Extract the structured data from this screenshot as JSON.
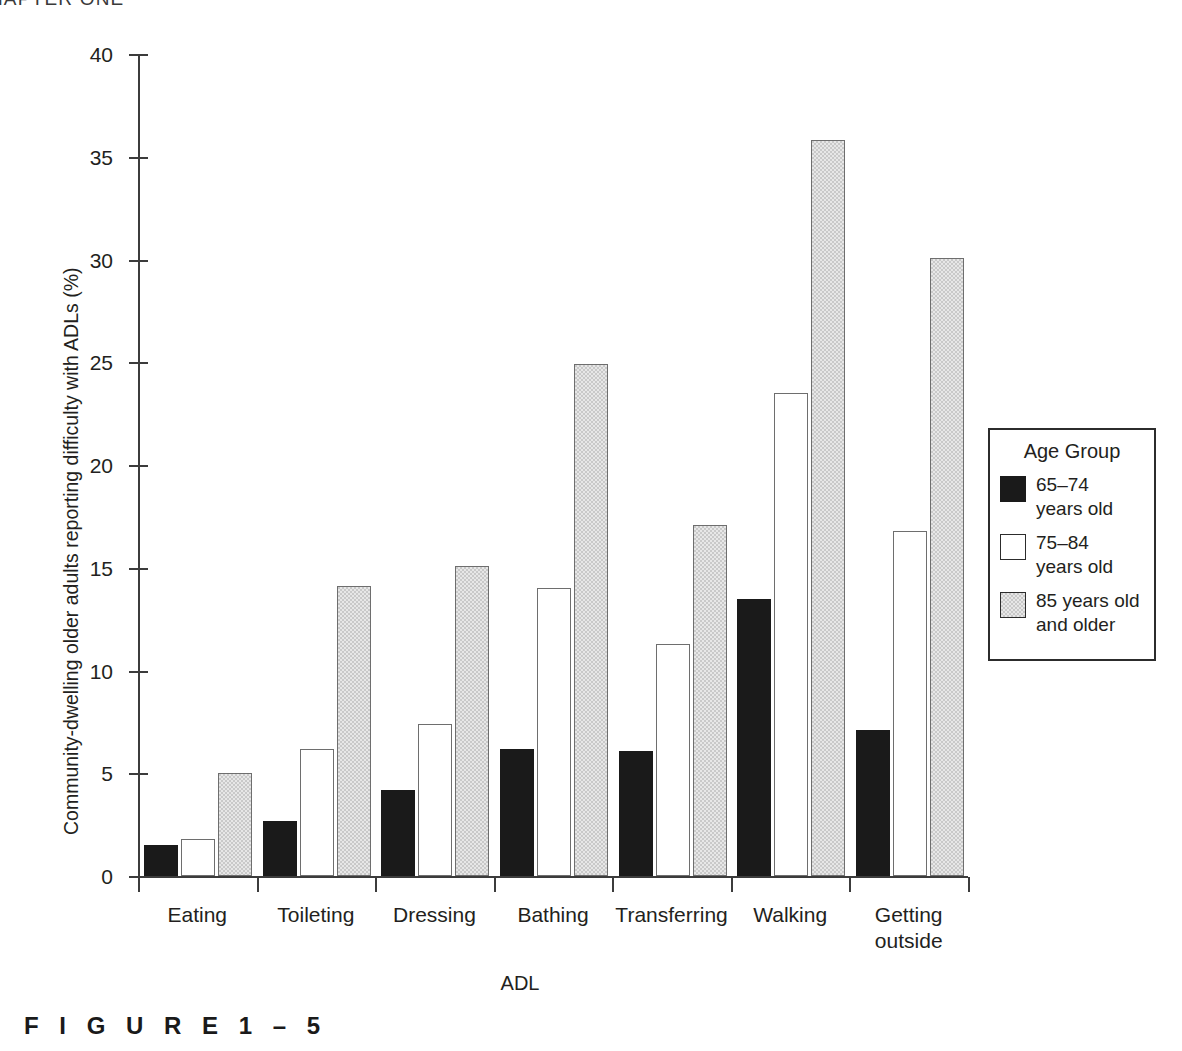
{
  "running_head": "CHAPTER ONE",
  "figure_caption": "F I G U R E   1 – 5",
  "legend": {
    "title": "Age Group",
    "entries": [
      {
        "swatch": "black-solid",
        "label": "65–74\nyears old"
      },
      {
        "swatch": "white-outline",
        "label": "75–84\nyears old"
      },
      {
        "swatch": "gray-stipple",
        "label": "85 years old\nand older"
      }
    ]
  },
  "colors": {
    "series_65_74": "#1a1a1a",
    "series_75_84": "#ffffff",
    "series_85_plus": "#c9c9c9",
    "axis": "#3c3c3c",
    "text": "#231f20"
  },
  "chart_data": {
    "type": "bar",
    "title": "",
    "xlabel": "ADL",
    "ylabel": "Community-dwelling older adults reporting difficulty with ADLs (%)",
    "ylim": [
      0,
      40
    ],
    "yticks": [
      0,
      5,
      10,
      15,
      20,
      25,
      30,
      35,
      40
    ],
    "ytick_labels": [
      "0",
      "5",
      "10",
      "15",
      "20",
      "25",
      "30",
      "35",
      "40"
    ],
    "grid": false,
    "legend_position": "right",
    "legend_title": "Age Group",
    "categories": [
      "Eating",
      "Toileting",
      "Dressing",
      "Bathing",
      "Transferring",
      "Walking",
      "Getting\noutside"
    ],
    "series": [
      {
        "name": "65–74 years old",
        "values": [
          1.4,
          2.6,
          4.1,
          6.1,
          6.0,
          13.4,
          7.0
        ]
      },
      {
        "name": "75–84 years old",
        "values": [
          1.7,
          6.1,
          7.3,
          13.9,
          11.2,
          23.4,
          16.7
        ]
      },
      {
        "name": "85 years old and older",
        "values": [
          4.9,
          14.0,
          15.0,
          24.8,
          17.0,
          35.7,
          30.0
        ]
      }
    ]
  }
}
